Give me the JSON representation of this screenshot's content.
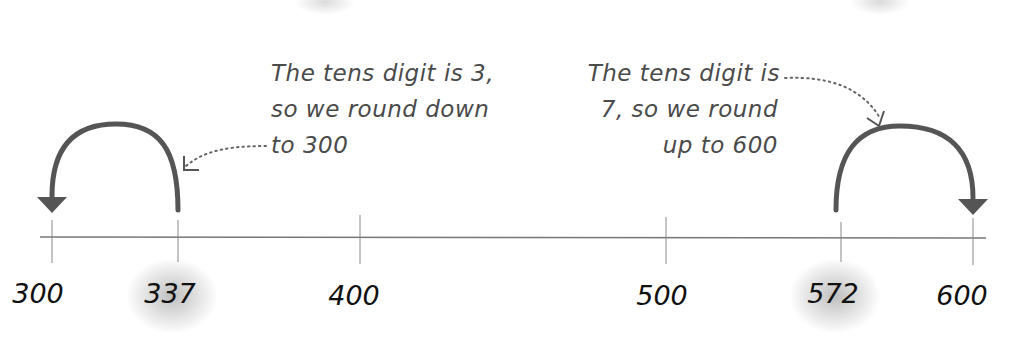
{
  "diagram": {
    "type": "number-line-rounding",
    "colors": {
      "arrow": "#555555",
      "axis": "#777777",
      "note_text": "#4a4a4a",
      "label_text": "#111111",
      "highlight": "#bbbbbb"
    },
    "ticks": [
      {
        "value": "300",
        "x": 52,
        "highlighted": false
      },
      {
        "value": "337",
        "x": 178,
        "highlighted": true
      },
      {
        "value": "400",
        "x": 360,
        "highlighted": false
      },
      {
        "value": "500",
        "x": 666,
        "highlighted": false
      },
      {
        "value": "572",
        "x": 841,
        "highlighted": true
      },
      {
        "value": "600",
        "x": 973,
        "highlighted": false
      }
    ],
    "annotations": {
      "left": {
        "lines": [
          "The tens digit is 3,",
          "so we round down",
          "to 300"
        ],
        "from": "337",
        "to": "300",
        "direction": "down"
      },
      "right": {
        "lines": [
          "The tens digit is",
          "7, so we round",
          "up to 600"
        ],
        "from": "572",
        "to": "600",
        "direction": "up"
      }
    }
  }
}
